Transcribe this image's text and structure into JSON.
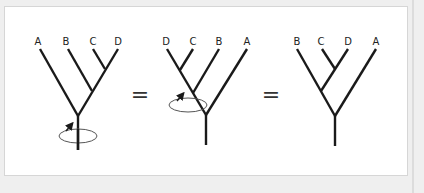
{
  "diagram": {
    "equals_symbol": "=",
    "colors": {
      "branch": "#1a1a1a",
      "rotation_arrow": "#555555",
      "background": "#efefef",
      "panel": "#ffffff"
    },
    "trees": [
      {
        "id": "tree-1",
        "tip_labels": [
          "A",
          "B",
          "C",
          "D"
        ],
        "rotation_node": "root"
      },
      {
        "id": "tree-2",
        "tip_labels": [
          "D",
          "C",
          "B",
          "A"
        ],
        "rotation_node": "BCD-ancestor"
      },
      {
        "id": "tree-3",
        "tip_labels": [
          "B",
          "C",
          "D",
          "A"
        ],
        "rotation_node": "none"
      }
    ]
  }
}
